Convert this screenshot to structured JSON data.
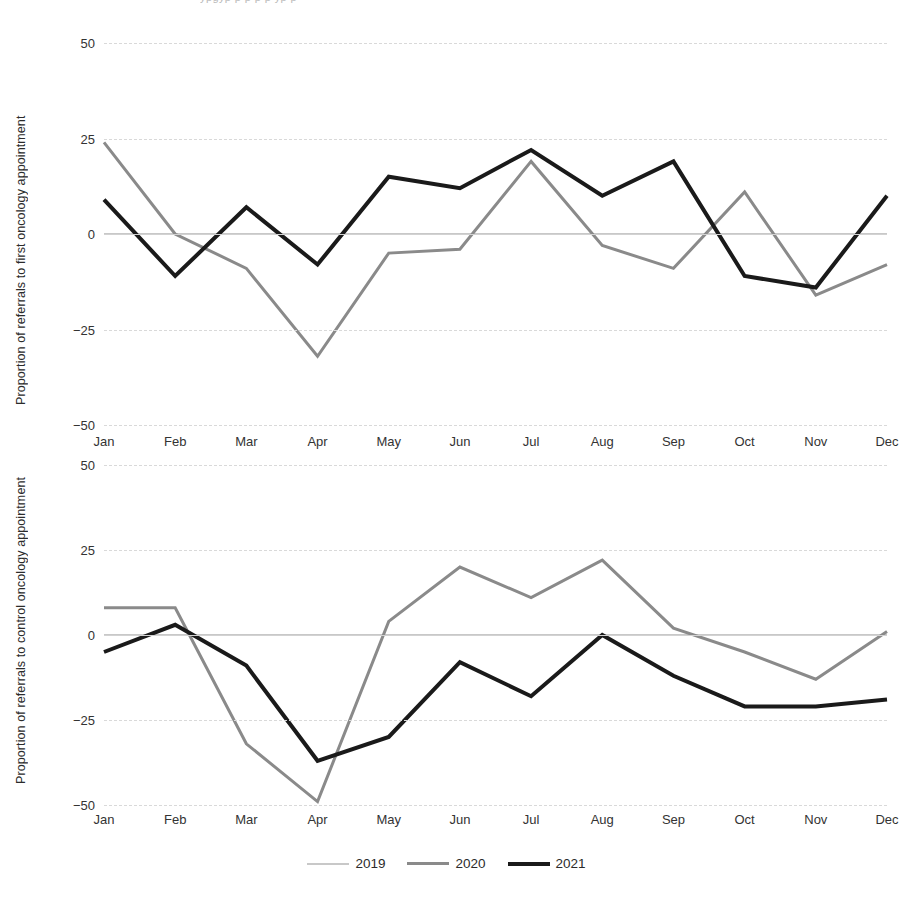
{
  "top_crop_text": "ypgyp p p p p yp p",
  "legend": {
    "items": [
      {
        "label": "2019",
        "color": "#c8c8c8",
        "width": 2
      },
      {
        "label": "2020",
        "color": "#8a8a8a",
        "width": 3
      },
      {
        "label": "2021",
        "color": "#1a1a1a",
        "width": 4
      }
    ]
  },
  "panels": [
    {
      "id": "top",
      "ylabel": "Proportion of referrals to first oncology appointment"
    },
    {
      "id": "bottom",
      "ylabel": "Proportion of referrals to control oncology appointment"
    }
  ],
  "chart_data": [
    {
      "type": "line",
      "title": "",
      "xlabel": "",
      "ylabel": "Proportion of referrals to first oncology appointment",
      "categories": [
        "Jan",
        "Feb",
        "Mar",
        "Apr",
        "May",
        "Jun",
        "Jul",
        "Aug",
        "Sep",
        "Oct",
        "Nov",
        "Dec"
      ],
      "yticks": [
        50,
        25,
        0,
        -25,
        -50
      ],
      "ylim": [
        -50,
        50
      ],
      "grid": true,
      "legend_position": "bottom",
      "series": [
        {
          "name": "2019",
          "color": "#c8c8c8",
          "width": 2,
          "values": [
            0,
            0,
            0,
            0,
            0,
            0,
            0,
            0,
            0,
            0,
            0,
            0
          ]
        },
        {
          "name": "2020",
          "color": "#8a8a8a",
          "width": 3,
          "values": [
            24,
            0,
            -9,
            -32,
            -5,
            -4,
            19,
            -3,
            -9,
            11,
            -16,
            -8
          ]
        },
        {
          "name": "2021",
          "color": "#1a1a1a",
          "width": 4,
          "values": [
            9,
            -11,
            7,
            -8,
            15,
            12,
            22,
            10,
            19,
            -11,
            -14,
            10
          ]
        }
      ]
    },
    {
      "type": "line",
      "title": "",
      "xlabel": "",
      "ylabel": "Proportion of referrals to control oncology appointment",
      "categories": [
        "Jan",
        "Feb",
        "Mar",
        "Apr",
        "May",
        "Jun",
        "Jul",
        "Aug",
        "Sep",
        "Oct",
        "Nov",
        "Dec"
      ],
      "yticks": [
        50,
        25,
        0,
        -25,
        -50
      ],
      "ylim": [
        -50,
        50
      ],
      "grid": true,
      "legend_position": "bottom",
      "series": [
        {
          "name": "2019",
          "color": "#c8c8c8",
          "width": 2,
          "values": [
            0,
            0,
            0,
            0,
            0,
            0,
            0,
            0,
            0,
            0,
            0,
            0
          ]
        },
        {
          "name": "2020",
          "color": "#8a8a8a",
          "width": 3,
          "values": [
            8,
            8,
            -32,
            -49,
            4,
            20,
            11,
            22,
            2,
            -5,
            -13,
            1
          ]
        },
        {
          "name": "2021",
          "color": "#1a1a1a",
          "width": 4,
          "values": [
            -5,
            3,
            -9,
            -37,
            -30,
            -8,
            -18,
            0,
            -12,
            -21,
            -21,
            -19
          ]
        }
      ]
    }
  ]
}
